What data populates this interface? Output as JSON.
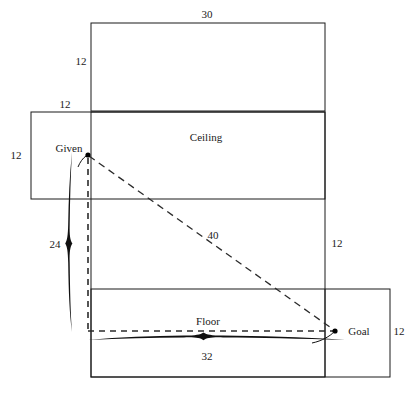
{
  "diagram": {
    "labels": {
      "ceiling": "Ceiling",
      "floor": "Floor",
      "given": "Given",
      "goal": "Goal"
    },
    "dimensions": {
      "top_width": "30",
      "top_height": "12",
      "upper_left_offset": "12",
      "left_side_height": "12",
      "left_brace": "24",
      "right_side_height": "12",
      "bottom_right_height": "12",
      "bottom_brace": "32",
      "diagonal_path": "40"
    },
    "colors": {
      "stroke": "#1a1a1a",
      "dash": "#2b2b2b",
      "background": "#ffffff"
    }
  }
}
